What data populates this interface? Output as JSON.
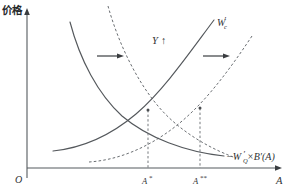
{
  "figure": {
    "background_color": "#ffffff",
    "line_color": "#54585c",
    "axes": {
      "y_label": "价格",
      "x_label": "A",
      "origin_label": "O"
    },
    "ticks": {
      "x": [
        {
          "label_base": "A",
          "label_sup": "*",
          "value": "A*"
        },
        {
          "label_base": "A",
          "label_sup": "**",
          "value": "A**"
        }
      ]
    },
    "curves": [
      {
        "name": "marginal-benefit-curve",
        "label_base": "−W",
        "label_sub": "Q",
        "label_prime": "′",
        "label_tail": "×B′(A)",
        "label_full": "−W′Q×B′(A)",
        "style": "solid",
        "slope": "decreasing"
      },
      {
        "name": "marginal-cost-curve",
        "label_base": "W",
        "label_sub": "c",
        "label_prime": "′",
        "label_full": "W′c",
        "style": "solid",
        "slope": "increasing"
      },
      {
        "name": "shifted-benefit-curve",
        "style": "dashed",
        "slope": "decreasing"
      },
      {
        "name": "shifted-cost-curve",
        "style": "dashed",
        "slope": "increasing"
      }
    ],
    "annotations": [
      {
        "name": "income-shift",
        "text": "Y",
        "arrow": "↑"
      },
      {
        "name": "left-shift-arrow",
        "direction": "right"
      },
      {
        "name": "right-shift-arrow",
        "direction": "right"
      }
    ]
  }
}
